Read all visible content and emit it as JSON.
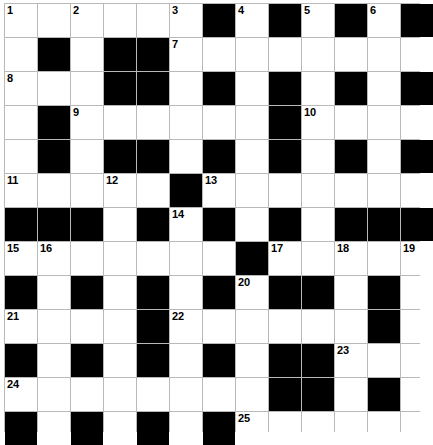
{
  "puzzle": {
    "title": "Crossword Grid",
    "rows": 13,
    "columns": 13,
    "colors": {
      "block": "#000000",
      "cell": "#ffffff",
      "grid_line": "#b9b9b9",
      "number": "#000000"
    },
    "legend": {
      "block_label": "blocked-square",
      "open_label": "open-square"
    },
    "grid": [
      [
        "open",
        "open",
        "open",
        "open",
        "open",
        "open",
        "block",
        "open",
        "block",
        "open",
        "block",
        "open",
        "block"
      ],
      [
        "open",
        "block",
        "open",
        "block",
        "block",
        "open",
        "open",
        "open",
        "open",
        "open",
        "open",
        "open",
        "open"
      ],
      [
        "open",
        "open",
        "open",
        "block",
        "block",
        "open",
        "block",
        "open",
        "block",
        "open",
        "block",
        "open",
        "block"
      ],
      [
        "open",
        "block",
        "open",
        "open",
        "open",
        "open",
        "open",
        "open",
        "block",
        "open",
        "open",
        "open",
        "open"
      ],
      [
        "open",
        "block",
        "open",
        "block",
        "block",
        "open",
        "block",
        "open",
        "block",
        "open",
        "block",
        "open",
        "block"
      ],
      [
        "open",
        "open",
        "open",
        "open",
        "open",
        "block",
        "open",
        "open",
        "open",
        "open",
        "open",
        "open",
        "open"
      ],
      [
        "block",
        "block",
        "block",
        "open",
        "block",
        "open",
        "block",
        "open",
        "block",
        "open",
        "block",
        "block",
        "block"
      ],
      [
        "open",
        "open",
        "open",
        "open",
        "open",
        "open",
        "open",
        "block",
        "open",
        "open",
        "open",
        "open",
        "open"
      ],
      [
        "block",
        "open",
        "block",
        "open",
        "block",
        "open",
        "block",
        "open",
        "block",
        "block",
        "open",
        "block",
        "open"
      ],
      [
        "open",
        "open",
        "open",
        "open",
        "block",
        "open",
        "open",
        "open",
        "open",
        "open",
        "open",
        "block",
        "open"
      ],
      [
        "block",
        "open",
        "block",
        "open",
        "block",
        "open",
        "block",
        "open",
        "block",
        "block",
        "open",
        "open",
        "open"
      ],
      [
        "open",
        "open",
        "open",
        "open",
        "open",
        "open",
        "open",
        "open",
        "block",
        "block",
        "open",
        "block",
        "open"
      ],
      [
        "block",
        "open",
        "block",
        "open",
        "block",
        "open",
        "block",
        "open",
        "open",
        "open",
        "open",
        "open",
        "open"
      ]
    ],
    "numbers": [
      {
        "row": 1,
        "col": 1,
        "label": "1"
      },
      {
        "row": 1,
        "col": 3,
        "label": "2"
      },
      {
        "row": 1,
        "col": 6,
        "label": "3"
      },
      {
        "row": 1,
        "col": 8,
        "label": "4"
      },
      {
        "row": 1,
        "col": 10,
        "label": "5"
      },
      {
        "row": 1,
        "col": 12,
        "label": "6"
      },
      {
        "row": 2,
        "col": 6,
        "label": "7"
      },
      {
        "row": 3,
        "col": 1,
        "label": "8"
      },
      {
        "row": 4,
        "col": 3,
        "label": "9"
      },
      {
        "row": 4,
        "col": 10,
        "label": "10"
      },
      {
        "row": 6,
        "col": 1,
        "label": "11"
      },
      {
        "row": 6,
        "col": 4,
        "label": "12"
      },
      {
        "row": 6,
        "col": 7,
        "label": "13"
      },
      {
        "row": 7,
        "col": 6,
        "label": "14"
      },
      {
        "row": 8,
        "col": 1,
        "label": "15"
      },
      {
        "row": 8,
        "col": 2,
        "label": "16"
      },
      {
        "row": 8,
        "col": 9,
        "label": "17"
      },
      {
        "row": 8,
        "col": 11,
        "label": "18"
      },
      {
        "row": 8,
        "col": 13,
        "label": "19"
      },
      {
        "row": 9,
        "col": 8,
        "label": "20"
      },
      {
        "row": 10,
        "col": 1,
        "label": "21"
      },
      {
        "row": 10,
        "col": 6,
        "label": "22"
      },
      {
        "row": 11,
        "col": 11,
        "label": "23"
      },
      {
        "row": 12,
        "col": 1,
        "label": "24"
      },
      {
        "row": 13,
        "col": 8,
        "label": "25"
      }
    ],
    "entries": []
  }
}
